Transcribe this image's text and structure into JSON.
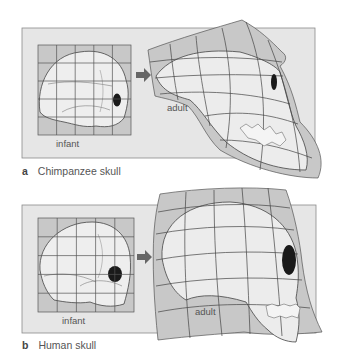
{
  "colors": {
    "panel_bg": "#e6e6e6",
    "panel_border": "#8a8a8a",
    "grid_light": "#d2d2d2",
    "grid_dark": "#b4b4b4",
    "skull_fill": "#ececec",
    "line": "#444444",
    "orbit": "#1a1a1a",
    "arrow": "#666666"
  },
  "figures": [
    {
      "id": "a",
      "letter": "a",
      "caption": "Chimpanzee skull",
      "infant_label": "infant",
      "adult_label": "adult"
    },
    {
      "id": "b",
      "letter": "b",
      "caption": "Human skull",
      "infant_label": "infant",
      "adult_label": "adult"
    }
  ]
}
